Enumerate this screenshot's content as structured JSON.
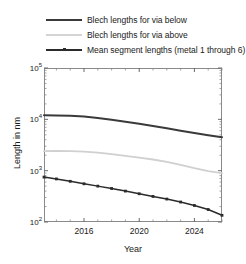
{
  "legend": {
    "position": "above-plot",
    "items": [
      {
        "label": "Blech lengths for via below",
        "color": "#3a3a3a",
        "style": "solid",
        "marker": "none",
        "width": 2
      },
      {
        "label": "Blech lengths for via above",
        "color": "#d0d0d0",
        "style": "solid",
        "marker": "none",
        "width": 1.6
      },
      {
        "label": "Mean segment lengths (metal 1 through 6)",
        "color": "#2b2b2b",
        "style": "solid",
        "marker": "square",
        "width": 1.6
      }
    ]
  },
  "axes": {
    "xlabel": "Year",
    "ylabel": "Length in nm",
    "x_ticks": [
      {
        "value": 2016,
        "label": "2016"
      },
      {
        "value": 2020,
        "label": "2020"
      },
      {
        "value": 2024,
        "label": "2024"
      }
    ],
    "y_ticks": [
      {
        "value": 100,
        "mantissa": "10",
        "exponent": "2"
      },
      {
        "value": 1000,
        "mantissa": "10",
        "exponent": "3"
      },
      {
        "value": 10000,
        "mantissa": "10",
        "exponent": "4"
      },
      {
        "value": 100000,
        "mantissa": "10",
        "exponent": "5"
      }
    ],
    "yscale": "log",
    "xlim": [
      2013.1,
      2026.0
    ],
    "ylim": [
      100,
      100000
    ],
    "grid": false,
    "frame_color": "#8a8a8a"
  },
  "chart_data": {
    "type": "line",
    "title": "",
    "xlabel": "Year",
    "ylabel": "Length in nm",
    "xlim": [
      2013.1,
      2026.0
    ],
    "ylim": [
      100,
      100000
    ],
    "yscale": "log",
    "grid": false,
    "legend_position": "above-plot",
    "x": [
      2013.1,
      2014,
      2015,
      2016,
      2017,
      2018,
      2019,
      2020,
      2021,
      2022,
      2023,
      2024,
      2025,
      2026
    ],
    "series": [
      {
        "name": "Blech lengths for via below",
        "color": "#3a3a3a",
        "marker": "none",
        "values": [
          12000,
          11900,
          11700,
          11300,
          10600,
          9800,
          9000,
          8200,
          7400,
          6700,
          6000,
          5400,
          4900,
          4500
        ]
      },
      {
        "name": "Blech lengths for via above",
        "color": "#d0d0d0",
        "marker": "none",
        "values": [
          2400,
          2420,
          2400,
          2350,
          2250,
          2100,
          1950,
          1800,
          1650,
          1480,
          1300,
          1120,
          980,
          900
        ]
      },
      {
        "name": "Mean segment lengths (metal 1 through 6)",
        "color": "#2b2b2b",
        "marker": "square",
        "values": [
          750,
          690,
          620,
          555,
          500,
          450,
          400,
          355,
          315,
          280,
          245,
          210,
          175,
          135
        ]
      }
    ]
  }
}
